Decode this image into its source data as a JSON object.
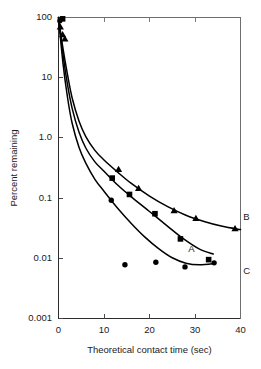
{
  "chart_data": {
    "type": "line",
    "title": "",
    "subtitle": "",
    "xlabel": "Theoretical contact time (sec)",
    "ylabel": "Percent remaining",
    "xlim": [
      0,
      40
    ],
    "ylim": [
      0.001,
      100
    ],
    "yscale": "log",
    "xscale": "linear",
    "grid": false,
    "legend_position": "inline-right-curve-labels",
    "xticks": [
      0,
      10,
      20,
      30,
      40
    ],
    "xtick_labels": [
      "0",
      "10",
      "20",
      "30",
      "40"
    ],
    "yticks": [
      100,
      10,
      1.0,
      0.1,
      0.01,
      0.001
    ],
    "ytick_labels": [
      "100",
      "10",
      "1.0",
      "0.1",
      "0.01",
      "0.001"
    ],
    "annotations": [
      {
        "text": "A",
        "x": 28.5,
        "y": 0.0145,
        "series": "A"
      },
      {
        "text": "B",
        "x": 40.6,
        "y": 0.05,
        "series": "B"
      },
      {
        "text": "C",
        "x": 40.6,
        "y": 0.0062,
        "series": "C"
      }
    ],
    "series": [
      {
        "name": "B",
        "label": "B",
        "marker": "triangle",
        "color": "#000000",
        "plateau": 0.029,
        "points": [
          {
            "x": 0.4,
            "y": 70
          },
          {
            "x": 0.9,
            "y": 52
          },
          {
            "x": 1.4,
            "y": 44
          },
          {
            "x": 13.2,
            "y": 0.3
          },
          {
            "x": 17.6,
            "y": 0.145
          },
          {
            "x": 25.4,
            "y": 0.062
          },
          {
            "x": 30.2,
            "y": 0.046
          },
          {
            "x": 38.8,
            "y": 0.031
          }
        ],
        "curve": [
          {
            "x": 0.0,
            "y": 100
          },
          {
            "x": 1.0,
            "y": 30
          },
          {
            "x": 2.0,
            "y": 11
          },
          {
            "x": 3.0,
            "y": 4.6
          },
          {
            "x": 4.5,
            "y": 1.9
          },
          {
            "x": 6.0,
            "y": 1.05
          },
          {
            "x": 8.0,
            "y": 0.62
          },
          {
            "x": 10.0,
            "y": 0.43
          },
          {
            "x": 13.0,
            "y": 0.27
          },
          {
            "x": 16.0,
            "y": 0.175
          },
          {
            "x": 20.0,
            "y": 0.108
          },
          {
            "x": 24.0,
            "y": 0.072
          },
          {
            "x": 28.0,
            "y": 0.052
          },
          {
            "x": 32.0,
            "y": 0.041
          },
          {
            "x": 36.0,
            "y": 0.034
          },
          {
            "x": 40.0,
            "y": 0.03
          }
        ]
      },
      {
        "name": "A",
        "label": "A",
        "marker": "square",
        "color": "#000000",
        "plateau": 0.012,
        "points": [
          {
            "x": 0.9,
            "y": 95
          },
          {
            "x": 11.8,
            "y": 0.215
          },
          {
            "x": 15.6,
            "y": 0.115
          },
          {
            "x": 21.2,
            "y": 0.055
          },
          {
            "x": 26.8,
            "y": 0.021
          },
          {
            "x": 33.0,
            "y": 0.0095
          }
        ],
        "curve": [
          {
            "x": 0.0,
            "y": 100
          },
          {
            "x": 1.0,
            "y": 24
          },
          {
            "x": 2.0,
            "y": 7.5
          },
          {
            "x": 3.0,
            "y": 3.1
          },
          {
            "x": 4.5,
            "y": 1.25
          },
          {
            "x": 6.0,
            "y": 0.68
          },
          {
            "x": 8.0,
            "y": 0.4
          },
          {
            "x": 10.0,
            "y": 0.28
          },
          {
            "x": 13.0,
            "y": 0.165
          },
          {
            "x": 16.0,
            "y": 0.105
          },
          {
            "x": 20.0,
            "y": 0.06
          },
          {
            "x": 24.0,
            "y": 0.034
          },
          {
            "x": 27.5,
            "y": 0.021
          },
          {
            "x": 31.0,
            "y": 0.0142
          },
          {
            "x": 34.0,
            "y": 0.0118
          }
        ]
      },
      {
        "name": "C",
        "label": "C",
        "marker": "circle",
        "color": "#000000",
        "plateau": 0.008,
        "points": [
          {
            "x": 0.3,
            "y": 88
          },
          {
            "x": 11.6,
            "y": 0.092
          },
          {
            "x": 14.6,
            "y": 0.0078
          },
          {
            "x": 21.4,
            "y": 0.0086
          },
          {
            "x": 27.8,
            "y": 0.0072
          },
          {
            "x": 34.2,
            "y": 0.0084
          }
        ],
        "curve": [
          {
            "x": 0.0,
            "y": 100
          },
          {
            "x": 1.0,
            "y": 17
          },
          {
            "x": 2.0,
            "y": 4.6
          },
          {
            "x": 3.0,
            "y": 1.75
          },
          {
            "x": 4.5,
            "y": 0.7
          },
          {
            "x": 6.0,
            "y": 0.38
          },
          {
            "x": 8.0,
            "y": 0.205
          },
          {
            "x": 10.0,
            "y": 0.13
          },
          {
            "x": 13.0,
            "y": 0.068
          },
          {
            "x": 16.0,
            "y": 0.038
          },
          {
            "x": 19.0,
            "y": 0.0225
          },
          {
            "x": 22.0,
            "y": 0.0145
          },
          {
            "x": 25.0,
            "y": 0.0102
          },
          {
            "x": 28.0,
            "y": 0.0083
          },
          {
            "x": 31.0,
            "y": 0.0078
          },
          {
            "x": 34.5,
            "y": 0.0082
          }
        ]
      }
    ]
  }
}
